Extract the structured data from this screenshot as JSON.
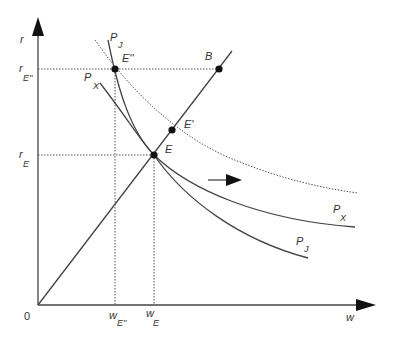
{
  "diagram": {
    "axes": {
      "y_label": "r",
      "x_label": "w",
      "origin_label": "0"
    },
    "y_ticks": [
      {
        "main": "r",
        "sub": "E''"
      },
      {
        "main": "r",
        "sub": "E"
      }
    ],
    "x_ticks": [
      {
        "main": "w",
        "sub": "E''"
      },
      {
        "main": "w",
        "sub": "E"
      }
    ],
    "points": [
      {
        "id": "E",
        "label": "E"
      },
      {
        "id": "E1",
        "label": "E'"
      },
      {
        "id": "E2",
        "label": "E''"
      },
      {
        "id": "B",
        "label": "B"
      }
    ],
    "curves": [
      {
        "id": "PJ",
        "main": "P",
        "sub": "J"
      },
      {
        "id": "PX",
        "main": "P",
        "sub": "X"
      }
    ],
    "shift_arrow": "rightward shift",
    "colors": {
      "line": "#444444",
      "point": "#111111",
      "background": "#ffffff"
    }
  }
}
